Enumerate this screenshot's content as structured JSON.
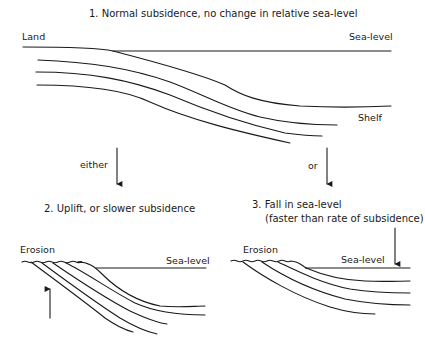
{
  "panel1": {
    "title": "1.  Normal subsidence, no change in relative sea-level",
    "labels": {
      "land": "Land",
      "sea_level": "Sea-level",
      "shelf": "Shelf"
    }
  },
  "transitions": {
    "left": "either",
    "right": "or"
  },
  "panel2": {
    "title": "2.  Uplift, or slower subsidence",
    "labels": {
      "erosion": "Erosion",
      "sea_level": "Sea-level"
    },
    "arrow": "up"
  },
  "panel3": {
    "title_line1": "3.  Fall in sea-level",
    "title_line2": "(faster than rate of subsidence)",
    "labels": {
      "erosion": "Erosion",
      "sea_level": "Sea-level"
    },
    "arrow": "down"
  },
  "colors": {
    "line": "#1a1a1a",
    "background": "#ffffff"
  }
}
